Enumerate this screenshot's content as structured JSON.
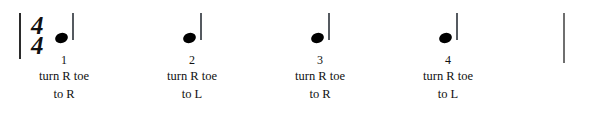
{
  "notation": {
    "time_signature": {
      "numerator": "4",
      "denominator": "4"
    },
    "note_value": "quarter-note",
    "barline_left": "|",
    "barline_right": "|"
  },
  "beats": [
    {
      "number": "1",
      "instruction_line1": "turn R toe",
      "instruction_line2": "to R",
      "center_x": 64
    },
    {
      "number": "2",
      "instruction_line1": "turn R toe",
      "instruction_line2": "to L",
      "center_x": 192
    },
    {
      "number": "3",
      "instruction_line1": "turn R toe",
      "instruction_line2": "to R",
      "center_x": 320
    },
    {
      "number": "4",
      "instruction_line1": "turn R toe",
      "instruction_line2": "to L",
      "center_x": 448
    }
  ],
  "colors": {
    "background": "#ffffff",
    "ink": "#111111",
    "note_head": "#000000",
    "note_stem": "#555a60",
    "barline": "#2b2b2b",
    "barline_end": "#6f6f6f"
  }
}
